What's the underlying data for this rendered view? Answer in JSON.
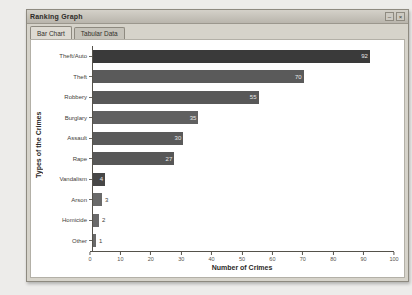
{
  "window": {
    "title": "Ranking Graph",
    "controls": [
      "–",
      "×"
    ]
  },
  "tabs": [
    {
      "label": "Bar Chart",
      "active": true
    },
    {
      "label": "Tabular Data",
      "active": false
    }
  ],
  "chart_data": {
    "type": "bar",
    "orientation": "horizontal",
    "title": "",
    "xlabel": "Number of Crimes",
    "ylabel": "Types of the Crimes",
    "xlim": [
      0,
      100
    ],
    "xticks": [
      0,
      10,
      20,
      30,
      40,
      50,
      60,
      70,
      80,
      90,
      100
    ],
    "grid": false,
    "legend": "none",
    "categories": [
      "Theft/Auto",
      "Theft",
      "Robbery",
      "Burglary",
      "Assault",
      "Rape",
      "Vandalism",
      "Arson",
      "Homicide",
      "Other"
    ],
    "values": [
      92,
      70,
      55,
      35,
      30,
      27,
      4,
      3,
      2,
      1
    ],
    "bar_colors": [
      "#3a3a3a",
      "#5a5a5a",
      "#585858",
      "#606060",
      "#5a5a5a",
      "#575757",
      "#474747",
      "#6a6a6a",
      "#6a6a6a",
      "#6a6a6a"
    ],
    "value_label_inside_min": 4
  },
  "colors": {
    "window_bg": "#d6d3ca",
    "chart_bg": "#ffffff",
    "axis": "#55524b",
    "page_bg": "#edecea"
  }
}
